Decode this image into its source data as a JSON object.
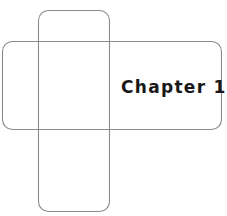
{
  "page": {
    "background_color": "#ffffff",
    "width": 227,
    "height": 216
  },
  "figure": {
    "name": "crossed-rounded-rectangles",
    "stroke_color": "#8a8a8a",
    "fill": "none",
    "shapes": [
      {
        "name": "horizontal-rounded-rectangle",
        "x": 2,
        "y": 41,
        "width": 220,
        "height": 89,
        "corner_radius": 10
      },
      {
        "name": "vertical-rounded-rectangle",
        "x": 38,
        "y": 10,
        "width": 72,
        "height": 202,
        "corner_radius": 10
      }
    ]
  },
  "label": {
    "text": "Chapter 15",
    "color": "#181818"
  }
}
